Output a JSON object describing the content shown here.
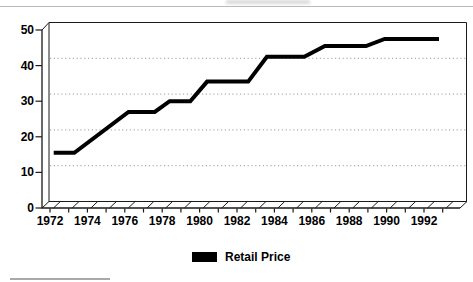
{
  "chart_data": {
    "type": "line",
    "title": "",
    "x_axis": {
      "label": "",
      "tick_labels": [
        "1972",
        "1974",
        "1976",
        "1978",
        "1980",
        "1982",
        "1984",
        "1986",
        "1988",
        "1990",
        "1992"
      ],
      "minor_ticks_every_year": true,
      "range_years": [
        1972,
        1993
      ]
    },
    "y_axis": {
      "label": "",
      "tick_labels": [
        "0",
        "10",
        "20",
        "30",
        "40",
        "50"
      ],
      "tick_values": [
        0,
        10,
        20,
        30,
        40,
        50
      ],
      "range": [
        0,
        50
      ],
      "gridlines_at": [
        10,
        20,
        30,
        40
      ],
      "gridline_style": "dotted"
    },
    "legend": {
      "position": "bottom-center",
      "entries": [
        {
          "label": "Retail Price",
          "swatch_color": "#000000"
        }
      ]
    },
    "series": [
      {
        "name": "Retail Price",
        "color": "#000000",
        "points_year_value": [
          [
            1972.2,
            15.5
          ],
          [
            1973.3,
            15.5
          ],
          [
            1976.2,
            27
          ],
          [
            1977.6,
            27
          ],
          [
            1978.4,
            30
          ],
          [
            1979.5,
            30
          ],
          [
            1980.4,
            35.5
          ],
          [
            1982.6,
            35.5
          ],
          [
            1983.6,
            42.5
          ],
          [
            1985.6,
            42.5
          ],
          [
            1986.7,
            45.5
          ],
          [
            1988.9,
            45.5
          ],
          [
            1989.9,
            47.5
          ],
          [
            1992.8,
            47.5
          ]
        ],
        "plateaus": [
          {
            "value": 15.5,
            "from_year": 1972,
            "to_year": 1973
          },
          {
            "value": 27,
            "from_year": 1976,
            "to_year": 1977
          },
          {
            "value": 30,
            "from_year": 1978,
            "to_year": 1979
          },
          {
            "value": 35.5,
            "from_year": 1980,
            "to_year": 1982
          },
          {
            "value": 42.5,
            "from_year": 1983,
            "to_year": 1985
          },
          {
            "value": 45.5,
            "from_year": 1986,
            "to_year": 1988
          },
          {
            "value": 47.5,
            "from_year": 1990,
            "to_year": 1992
          }
        ]
      }
    ],
    "style": {
      "frame": "3d-perspective",
      "floor_hatch": true,
      "background": "#ffffff",
      "axis_color": "#1a1a1a",
      "gridline_color": "#9a9a9a"
    }
  }
}
